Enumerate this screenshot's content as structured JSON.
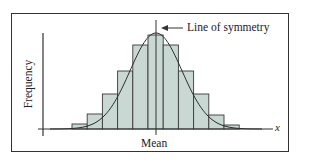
{
  "chart_data": {
    "type": "bar",
    "subtype": "histogram with normal curve overlay",
    "title": "",
    "xlabel": "x",
    "ylabel": "Frequency",
    "categories": [
      "b1",
      "b2",
      "b3",
      "b4",
      "b5",
      "b6",
      "b7",
      "b8",
      "b9",
      "b10",
      "b11"
    ],
    "values": [
      5,
      15,
      35,
      58,
      84,
      94,
      84,
      58,
      35,
      14,
      4
    ],
    "value_units": "relative frequency (arbitrary, no tick labels shown)",
    "ylim": [
      0,
      100
    ],
    "grid": false,
    "legend": null,
    "annotations": [
      {
        "text": "Line of symmetry",
        "type": "arrow-label",
        "points_to": "vertical line at mean"
      },
      {
        "text": "Mean",
        "type": "x-axis marker at center"
      }
    ],
    "overlay_curve": "normal (bell) curve symmetric about the mean",
    "colors": {
      "bar_fill": "#c9d8d3",
      "bar_edge": "#3a3a3a",
      "curve": "#2a2a2a",
      "axis": "#333333"
    }
  },
  "labels": {
    "symmetry": "Line of symmetry",
    "mean": "Mean",
    "x_axis": "x",
    "y_axis": "Frequency"
  }
}
